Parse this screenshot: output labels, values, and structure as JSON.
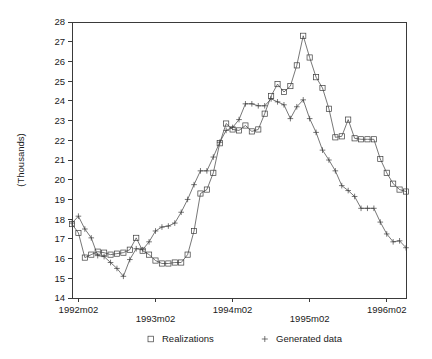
{
  "chart_data": {
    "type": "line",
    "title": "",
    "xlabel": "",
    "ylabel": "(Thousands)",
    "ylim": [
      14,
      28
    ],
    "yticks": [
      14,
      15,
      16,
      17,
      18,
      19,
      20,
      21,
      22,
      23,
      24,
      25,
      26,
      27,
      28
    ],
    "ytick_labels": [
      "14",
      "15",
      "16",
      "17",
      "18",
      "19",
      "20",
      "21",
      "22",
      "23",
      "24",
      "25",
      "26",
      "27",
      "28"
    ],
    "xtick_labels": [
      "1992m02",
      "1993m02",
      "1994m02",
      "1995m02",
      "1996m02"
    ],
    "xtick_index": [
      1,
      13,
      25,
      37,
      49
    ],
    "x_count": 53,
    "xlim_index": [
      0,
      52
    ],
    "grid": false,
    "legend_position": "bottom",
    "marker_colors": {
      "line": "#3c3c3c",
      "axis": "#3a3a3a",
      "background": "#ffffff"
    },
    "series": [
      {
        "name": "Realizations",
        "marker": "square",
        "values": [
          17.75,
          17.3,
          16.05,
          16.2,
          16.35,
          16.3,
          16.2,
          16.25,
          16.3,
          16.45,
          17.05,
          16.4,
          16.2,
          15.9,
          15.75,
          15.75,
          15.8,
          15.8,
          16.2,
          17.4,
          19.3,
          19.5,
          20.35,
          21.85,
          22.85,
          22.55,
          22.5,
          22.75,
          22.45,
          22.55,
          23.35,
          24.25,
          24.85,
          24.45,
          24.75,
          25.8,
          27.3,
          26.2,
          25.2,
          24.65,
          23.6,
          22.15,
          22.2,
          23.05,
          22.1,
          22.05,
          22.05,
          22.05,
          21.05,
          20.35,
          19.8,
          19.5,
          19.4
        ]
      },
      {
        "name": "Generated data",
        "marker": "plus",
        "values": [
          17.8,
          18.15,
          17.5,
          17.05,
          16.15,
          16.1,
          15.8,
          15.5,
          15.1,
          15.95,
          16.5,
          16.45,
          16.85,
          17.4,
          17.6,
          17.65,
          17.8,
          18.35,
          19.0,
          19.75,
          20.45,
          20.45,
          21.15,
          21.9,
          22.5,
          22.65,
          23.05,
          23.85,
          23.85,
          23.75,
          23.75,
          24.1,
          23.95,
          23.8,
          23.1,
          23.7,
          24.05,
          23.1,
          22.4,
          21.5,
          21.0,
          20.45,
          19.7,
          19.45,
          19.15,
          18.55,
          18.55,
          18.55,
          17.85,
          17.25,
          16.85,
          16.9,
          16.55
        ]
      }
    ]
  },
  "legend": {
    "items": [
      {
        "label": "Realizations",
        "marker": "square"
      },
      {
        "label": "Generated data",
        "marker": "plus"
      }
    ]
  }
}
